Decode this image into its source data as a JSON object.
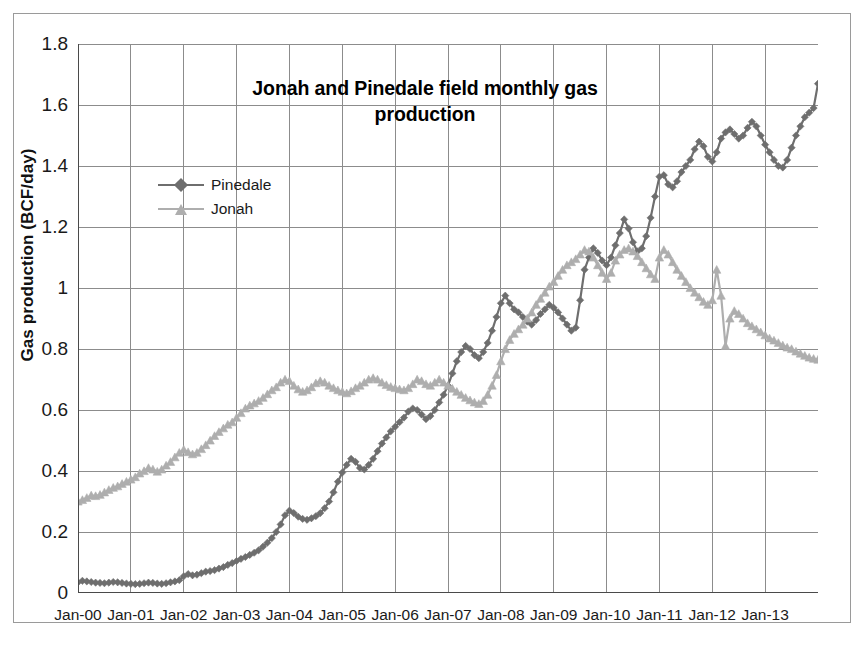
{
  "chart_data": {
    "type": "line",
    "title": "Jonah and Pinedale field monthly gas production",
    "title_line1": "Jonah and Pinedale field monthly gas",
    "title_line2": "production",
    "xlabel": "",
    "ylabel": "Gas production (BCF/day)",
    "ylim": [
      0,
      1.8
    ],
    "xlim": [
      "Jan-00",
      "Jan-14"
    ],
    "grid": true,
    "legend_position": "inside-upper-left",
    "ytick_labels": [
      "1.8",
      "1.6",
      "1.4",
      "1.2",
      "1",
      "0.8",
      "0.6",
      "0.4",
      "0.2",
      "0"
    ],
    "ytick_values": [
      1.8,
      1.6,
      1.4,
      1.2,
      1.0,
      0.8,
      0.6,
      0.4,
      0.2,
      0
    ],
    "xtick_labels": [
      "Jan-00",
      "Jan-01",
      "Jan-02",
      "Jan-03",
      "Jan-04",
      "Jan-05",
      "Jan-06",
      "Jan-07",
      "Jan-08",
      "Jan-09",
      "Jan-10",
      "Jan-11",
      "Jan-12",
      "Jan-13"
    ],
    "xtick_values": [
      0,
      12,
      24,
      36,
      48,
      60,
      72,
      84,
      96,
      108,
      120,
      132,
      144,
      156
    ],
    "x_start_month": 0,
    "x_month_count": 169,
    "colors": {
      "pinedale": "#6e6e6e",
      "jonah": "#aeaeae",
      "grid": "#8c8c8c",
      "axis": "#4a4a4a",
      "frame": "#9a9a9a",
      "text": "#111111"
    },
    "series": [
      {
        "name": "Pinedale",
        "marker": "diamond",
        "color": "#6e6e6e",
        "values": [
          0.035,
          0.04,
          0.038,
          0.036,
          0.034,
          0.033,
          0.032,
          0.034,
          0.036,
          0.035,
          0.033,
          0.031,
          0.03,
          0.029,
          0.03,
          0.032,
          0.034,
          0.033,
          0.031,
          0.03,
          0.032,
          0.035,
          0.038,
          0.042,
          0.055,
          0.062,
          0.058,
          0.06,
          0.065,
          0.07,
          0.072,
          0.075,
          0.08,
          0.085,
          0.092,
          0.098,
          0.105,
          0.112,
          0.118,
          0.125,
          0.132,
          0.14,
          0.152,
          0.165,
          0.18,
          0.2,
          0.225,
          0.255,
          0.27,
          0.262,
          0.25,
          0.243,
          0.24,
          0.245,
          0.252,
          0.262,
          0.278,
          0.3,
          0.33,
          0.365,
          0.395,
          0.42,
          0.44,
          0.43,
          0.41,
          0.405,
          0.42,
          0.44,
          0.465,
          0.49,
          0.51,
          0.53,
          0.545,
          0.56,
          0.575,
          0.595,
          0.605,
          0.6,
          0.585,
          0.57,
          0.58,
          0.6,
          0.625,
          0.65,
          0.68,
          0.72,
          0.76,
          0.79,
          0.81,
          0.8,
          0.78,
          0.77,
          0.79,
          0.82,
          0.86,
          0.905,
          0.95,
          0.975,
          0.95,
          0.93,
          0.92,
          0.905,
          0.89,
          0.88,
          0.895,
          0.915,
          0.93,
          0.945,
          0.935,
          0.92,
          0.9,
          0.88,
          0.86,
          0.87,
          0.96,
          1.06,
          1.1,
          1.13,
          1.115,
          1.09,
          1.075,
          1.1,
          1.14,
          1.18,
          1.225,
          1.195,
          1.15,
          1.12,
          1.13,
          1.17,
          1.23,
          1.3,
          1.365,
          1.37,
          1.34,
          1.33,
          1.35,
          1.38,
          1.4,
          1.42,
          1.455,
          1.48,
          1.465,
          1.43,
          1.415,
          1.445,
          1.49,
          1.51,
          1.52,
          1.505,
          1.49,
          1.5,
          1.525,
          1.545,
          1.53,
          1.5,
          1.47,
          1.445,
          1.42,
          1.4,
          1.395,
          1.42,
          1.46,
          1.5,
          1.53,
          1.56,
          1.575,
          1.59,
          1.67,
          1.6,
          1.57,
          1.545,
          1.52,
          1.49,
          1.47,
          1.45,
          1.46,
          1.48,
          1.47,
          1.445,
          1.42,
          1.4,
          1.385,
          1.37,
          1.355,
          1.345,
          1.35,
          1.365,
          1.38,
          1.375,
          1.36,
          1.37,
          1.372
        ]
      },
      {
        "name": "Jonah",
        "marker": "triangle",
        "color": "#aeaeae",
        "values": [
          0.3,
          0.305,
          0.312,
          0.32,
          0.318,
          0.322,
          0.33,
          0.338,
          0.345,
          0.35,
          0.358,
          0.365,
          0.372,
          0.38,
          0.392,
          0.4,
          0.41,
          0.405,
          0.398,
          0.405,
          0.418,
          0.43,
          0.445,
          0.46,
          0.47,
          0.462,
          0.455,
          0.46,
          0.472,
          0.485,
          0.5,
          0.515,
          0.528,
          0.54,
          0.552,
          0.56,
          0.575,
          0.59,
          0.605,
          0.615,
          0.622,
          0.63,
          0.64,
          0.652,
          0.665,
          0.675,
          0.69,
          0.7,
          0.695,
          0.68,
          0.668,
          0.66,
          0.665,
          0.675,
          0.688,
          0.695,
          0.69,
          0.68,
          0.672,
          0.665,
          0.66,
          0.655,
          0.662,
          0.672,
          0.68,
          0.69,
          0.7,
          0.705,
          0.7,
          0.69,
          0.682,
          0.676,
          0.672,
          0.668,
          0.665,
          0.672,
          0.685,
          0.7,
          0.695,
          0.685,
          0.68,
          0.69,
          0.7,
          0.69,
          0.68,
          0.67,
          0.66,
          0.65,
          0.64,
          0.632,
          0.625,
          0.62,
          0.63,
          0.65,
          0.68,
          0.715,
          0.76,
          0.8,
          0.83,
          0.85,
          0.865,
          0.88,
          0.9,
          0.92,
          0.945,
          0.965,
          0.985,
          1.005,
          1.02,
          1.04,
          1.06,
          1.075,
          1.085,
          1.095,
          1.11,
          1.125,
          1.12,
          1.1,
          1.075,
          1.05,
          1.03,
          1.05,
          1.09,
          1.11,
          1.125,
          1.13,
          1.12,
          1.105,
          1.085,
          1.065,
          1.045,
          1.03,
          1.1,
          1.125,
          1.11,
          1.085,
          1.06,
          1.04,
          1.02,
          1.0,
          0.985,
          0.97,
          0.955,
          0.945,
          0.96,
          1.06,
          0.975,
          0.81,
          0.9,
          0.925,
          0.915,
          0.9,
          0.885,
          0.875,
          0.865,
          0.855,
          0.845,
          0.835,
          0.828,
          0.82,
          0.812,
          0.805,
          0.8,
          0.792,
          0.785,
          0.778,
          0.772,
          0.768,
          0.765,
          0.762,
          0.76,
          0.758,
          0.756,
          0.754,
          0.752,
          0.748,
          0.742,
          0.735,
          0.728,
          0.722,
          0.715,
          0.708,
          0.7,
          0.694,
          0.688,
          0.682,
          0.676,
          0.67,
          0.664,
          0.658,
          0.652,
          0.646,
          0.635
        ]
      }
    ]
  },
  "figure": {
    "background_color": "#ffffff",
    "frame_color": "#9a9a9a"
  }
}
